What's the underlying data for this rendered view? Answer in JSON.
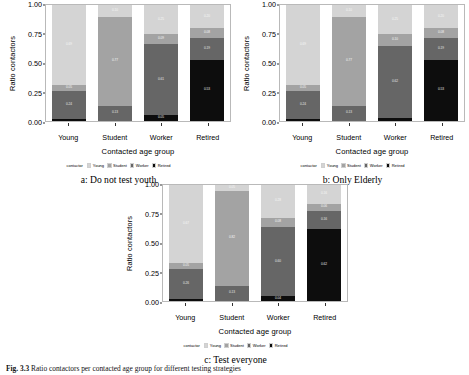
{
  "figure": {
    "caption_prefix": "Fig. 3.3",
    "caption_text": "Ratio contactors per contacted age group for different testing strategies"
  },
  "palette": {
    "Young": "#d4d4d4",
    "Student": "#a3a3a3",
    "Worker": "#666666",
    "Retired": "#0d0d0d"
  },
  "axis": {
    "ylabel": "Ratio contactors",
    "xlabel": "Contacted age group",
    "yticks": [
      "0.00",
      "0.25",
      "0.50",
      "0.75",
      "1.00"
    ],
    "ytick_values": [
      0.0,
      0.25,
      0.5,
      0.75,
      1.0
    ],
    "ylim": [
      0,
      1
    ],
    "xticks": [
      "Young",
      "Student",
      "Worker",
      "Retired"
    ]
  },
  "legend": {
    "title": "contactor",
    "position": "bottom",
    "items": [
      "Young",
      "Student",
      "Worker",
      "Retired"
    ]
  },
  "panels": [
    {
      "id": "a",
      "caption": "a: Do not test youth"
    },
    {
      "id": "b",
      "caption": "b: Only Elderly"
    },
    {
      "id": "c",
      "caption": "c: Test everyone"
    }
  ],
  "chart_data": [
    {
      "type": "bar",
      "stacked": true,
      "normalized": true,
      "panel": "a",
      "title": "a: Do not test youth",
      "xlabel": "Contacted age group",
      "ylabel": "Ratio contactors",
      "ylim": [
        0,
        1
      ],
      "grid": false,
      "legend_title": "contactor",
      "categories": [
        "Young",
        "Student",
        "Worker",
        "Retired"
      ],
      "series": [
        {
          "name": "Retired",
          "values": [
            0.02,
            0.0,
            0.05,
            0.53
          ]
        },
        {
          "name": "Worker",
          "values": [
            0.24,
            0.13,
            0.61,
            0.19
          ]
        },
        {
          "name": "Student",
          "values": [
            0.05,
            0.77,
            0.09,
            0.08
          ]
        },
        {
          "name": "Young",
          "values": [
            0.69,
            0.1,
            0.25,
            0.2
          ]
        }
      ]
    },
    {
      "type": "bar",
      "stacked": true,
      "normalized": true,
      "panel": "b",
      "title": "b: Only Elderly",
      "xlabel": "Contacted age group",
      "ylabel": "Ratio contactors",
      "ylim": [
        0,
        1
      ],
      "grid": false,
      "legend_title": "contactor",
      "categories": [
        "Young",
        "Student",
        "Worker",
        "Retired"
      ],
      "series": [
        {
          "name": "Retired",
          "values": [
            0.02,
            0.0,
            0.03,
            0.53
          ]
        },
        {
          "name": "Worker",
          "values": [
            0.24,
            0.13,
            0.62,
            0.19
          ]
        },
        {
          "name": "Student",
          "values": [
            0.05,
            0.77,
            0.1,
            0.08
          ]
        },
        {
          "name": "Young",
          "values": [
            0.69,
            0.1,
            0.25,
            0.2
          ]
        }
      ]
    },
    {
      "type": "bar",
      "stacked": true,
      "normalized": true,
      "panel": "c",
      "title": "c: Test everyone",
      "xlabel": "Contacted age group",
      "ylabel": "Ratio contactors",
      "ylim": [
        0,
        1
      ],
      "grid": false,
      "legend_title": "contactor",
      "categories": [
        "Young",
        "Student",
        "Worker",
        "Retired"
      ],
      "series": [
        {
          "name": "Retired",
          "values": [
            0.02,
            0.0,
            0.04,
            0.62
          ]
        },
        {
          "name": "Worker",
          "values": [
            0.26,
            0.13,
            0.6,
            0.16
          ]
        },
        {
          "name": "Student",
          "values": [
            0.05,
            0.82,
            0.08,
            0.06
          ]
        },
        {
          "name": "Young",
          "values": [
            0.67,
            0.05,
            0.28,
            0.16
          ]
        }
      ]
    }
  ]
}
